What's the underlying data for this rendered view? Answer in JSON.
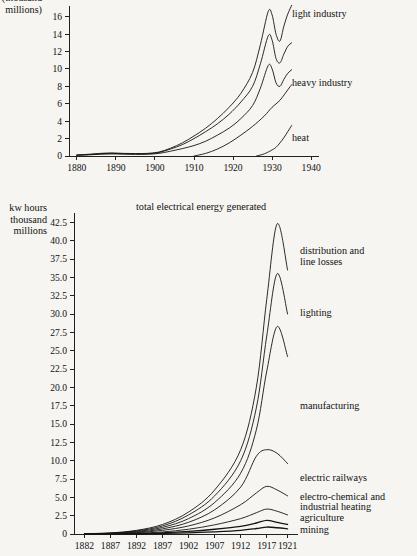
{
  "page": {
    "background_color": "#f6f5f1",
    "ink_color": "#141414"
  },
  "chart_data": [
    {
      "id": "top",
      "type": "line",
      "title": "",
      "ylabel_lines": [
        "(thousand",
        "millions)"
      ],
      "ylabel_line1": "(thousand",
      "ylabel_line2": "millions)",
      "xlabel": "",
      "grid": false,
      "legend_position": "right-inline",
      "xlim": [
        1878,
        1942
      ],
      "ylim": [
        0,
        17
      ],
      "xticks": [
        1880,
        1890,
        1900,
        1910,
        1920,
        1930,
        1940
      ],
      "xticklabels": [
        "1880",
        "1890",
        "1900",
        "1910",
        "1920",
        "1930",
        "1940"
      ],
      "yticks": [
        0,
        2,
        4,
        6,
        8,
        10,
        12,
        14,
        16
      ],
      "yticklabels": [
        "0",
        "2",
        "4",
        "6",
        "8",
        "10",
        "12",
        "14",
        "16"
      ],
      "series": [
        {
          "name": "light industry",
          "label": "light industry",
          "x": [
            1880,
            1883,
            1886,
            1889,
            1892,
            1895,
            1898,
            1901,
            1904,
            1907,
            1910,
            1913,
            1916,
            1919,
            1922,
            1925,
            1927,
            1929,
            1930,
            1931,
            1932,
            1933,
            1934,
            1935
          ],
          "values": [
            0.12,
            0.2,
            0.3,
            0.35,
            0.3,
            0.28,
            0.3,
            0.45,
            0.9,
            1.5,
            2.3,
            3.2,
            4.3,
            5.6,
            7.2,
            9.6,
            12.8,
            16.6,
            16.2,
            14.0,
            13.2,
            14.9,
            16.3,
            17.3
          ]
        },
        {
          "name": "heavy industry",
          "label": "heavy industry",
          "x": [
            1880,
            1883,
            1886,
            1889,
            1892,
            1895,
            1898,
            1901,
            1904,
            1907,
            1910,
            1913,
            1916,
            1919,
            1922,
            1925,
            1927,
            1929,
            1930,
            1931,
            1932,
            1933,
            1934,
            1935
          ],
          "values": [
            0.1,
            0.16,
            0.25,
            0.3,
            0.26,
            0.24,
            0.26,
            0.4,
            0.8,
            1.3,
            2.0,
            2.8,
            3.7,
            4.8,
            6.2,
            8.0,
            10.6,
            13.8,
            13.3,
            11.2,
            10.7,
            11.7,
            12.6,
            13.0
          ]
        },
        {
          "name": "heat",
          "label": "heat",
          "x": [
            1880,
            1883,
            1886,
            1889,
            1892,
            1895,
            1898,
            1901,
            1904,
            1907,
            1910,
            1913,
            1916,
            1919,
            1922,
            1925,
            1927,
            1929,
            1930,
            1931,
            1932,
            1933,
            1934,
            1935
          ],
          "values": [
            0.08,
            0.13,
            0.2,
            0.24,
            0.21,
            0.19,
            0.2,
            0.3,
            0.55,
            0.85,
            1.2,
            1.7,
            2.4,
            3.2,
            4.3,
            5.8,
            7.8,
            10.4,
            10.0,
            8.4,
            8.0,
            8.8,
            9.5,
            9.9
          ]
        },
        {
          "name": "heat-lower",
          "label": "",
          "x": [
            1910,
            1913,
            1916,
            1919,
            1922,
            1925,
            1928,
            1930,
            1932,
            1934,
            1935
          ],
          "values": [
            0.0,
            0.3,
            0.8,
            1.5,
            2.4,
            3.4,
            4.6,
            5.6,
            6.4,
            7.6,
            8.2
          ]
        },
        {
          "name": "heat-curve",
          "label": "",
          "x": [
            1926,
            1928,
            1930,
            1931,
            1932,
            1933,
            1934,
            1935
          ],
          "values": [
            0.0,
            0.25,
            0.7,
            1.0,
            1.5,
            2.1,
            2.8,
            3.5
          ]
        }
      ],
      "inline_labels": [
        {
          "text": "light industry",
          "x": 292,
          "y": 17
        },
        {
          "text": "heavy industry",
          "x": 292,
          "y": 86
        },
        {
          "text": "heat",
          "x": 292,
          "y": 141
        }
      ]
    },
    {
      "id": "bottom",
      "type": "line",
      "title": "total electrical energy generated",
      "ylabel_lines": [
        "kw hours",
        "thousand",
        "millions"
      ],
      "ylabel_line1": "kw hours",
      "ylabel_line2": "thousand",
      "ylabel_line3": "millions",
      "xlabel": "",
      "grid": false,
      "legend_position": "right-inline",
      "xlim": [
        1880,
        1923
      ],
      "ylim": [
        0,
        43.5
      ],
      "xticks": [
        1882,
        1887,
        1892,
        1897,
        1902,
        1907,
        1912,
        1917,
        1921
      ],
      "xticklabels": [
        "1882",
        "1887",
        "1892",
        "1897",
        "1902",
        "1907",
        "1912",
        "1917",
        "1921"
      ],
      "yticks": [
        0,
        2.5,
        5.0,
        7.5,
        10.0,
        12.5,
        15.0,
        17.5,
        20.0,
        22.5,
        25.0,
        27.5,
        30.0,
        32.5,
        35.0,
        37.5,
        40.0,
        42.5
      ],
      "yticklabels": [
        "0",
        "2.5",
        "5.0",
        "7.5",
        "10.0",
        "12.5",
        "15.0",
        "17.5",
        "20.0",
        "22.5",
        "25.0",
        "27.5",
        "30.0",
        "32.5",
        "35.0",
        "37.5",
        "40.0",
        "42.5"
      ],
      "series": [
        {
          "name": "total electrical energy generated",
          "label": "total electrical energy generated",
          "x": [
            1882,
            1887,
            1892,
            1897,
            1902,
            1907,
            1912,
            1915,
            1917,
            1919,
            1921
          ],
          "values": [
            0.05,
            0.15,
            0.5,
            1.3,
            3.0,
            6.0,
            11.5,
            20.0,
            32.0,
            42.3,
            36.0
          ]
        },
        {
          "name": "distribution and line losses",
          "label": "distribution and line losses",
          "x": [
            1882,
            1887,
            1892,
            1897,
            1902,
            1907,
            1912,
            1915,
            1917,
            1919,
            1921
          ],
          "values": [
            0.04,
            0.12,
            0.42,
            1.1,
            2.6,
            5.2,
            10.0,
            17.2,
            27.0,
            35.5,
            30.0
          ]
        },
        {
          "name": "lighting",
          "label": "lighting",
          "x": [
            1882,
            1887,
            1892,
            1897,
            1902,
            1907,
            1912,
            1915,
            1917,
            1919,
            1921
          ],
          "values": [
            0.03,
            0.1,
            0.34,
            0.9,
            2.1,
            4.3,
            8.3,
            14.2,
            22.2,
            28.3,
            24.2
          ]
        },
        {
          "name": "manufacturing",
          "label": "manufacturing",
          "x": [
            1882,
            1887,
            1892,
            1897,
            1902,
            1907,
            1912,
            1915,
            1917,
            1919,
            1921
          ],
          "values": [
            0.02,
            0.07,
            0.25,
            0.7,
            1.6,
            3.3,
            6.4,
            10.6,
            11.5,
            11.0,
            9.6
          ]
        },
        {
          "name": "electric railways",
          "label": "electric railways",
          "x": [
            1882,
            1887,
            1892,
            1897,
            1902,
            1907,
            1912,
            1915,
            1917,
            1919,
            1921
          ],
          "values": [
            0.015,
            0.05,
            0.18,
            0.5,
            1.1,
            2.2,
            4.0,
            5.6,
            6.5,
            6.0,
            5.2
          ]
        },
        {
          "name": "electro-chemical and industrial heating",
          "label": "electro-chemical and industrial heating",
          "x": [
            1882,
            1887,
            1892,
            1897,
            1902,
            1907,
            1912,
            1915,
            1917,
            1919,
            1921
          ],
          "values": [
            0.01,
            0.03,
            0.1,
            0.28,
            0.65,
            1.25,
            2.1,
            2.9,
            3.4,
            3.1,
            2.6
          ]
        },
        {
          "name": "agriculture",
          "label": "agriculture",
          "x": [
            1882,
            1887,
            1892,
            1897,
            1902,
            1907,
            1912,
            1915,
            1917,
            1919,
            1921
          ],
          "values": [
            0.008,
            0.02,
            0.06,
            0.16,
            0.35,
            0.65,
            1.05,
            1.5,
            1.85,
            1.6,
            1.3
          ]
        },
        {
          "name": "mining",
          "label": "mining",
          "x": [
            1882,
            1887,
            1892,
            1897,
            1902,
            1907,
            1912,
            1915,
            1917,
            1919,
            1921
          ],
          "values": [
            0.004,
            0.01,
            0.03,
            0.08,
            0.16,
            0.3,
            0.5,
            0.75,
            0.95,
            0.85,
            0.7
          ]
        }
      ],
      "inline_labels": [
        {
          "text": "distribution and",
          "x": 300,
          "y": 254
        },
        {
          "text": "line losses",
          "x": 300,
          "y": 265
        },
        {
          "text": "lighting",
          "x": 300,
          "y": 316
        },
        {
          "text": "manufacturing",
          "x": 300,
          "y": 409
        },
        {
          "text": "electric railways",
          "x": 300,
          "y": 481
        },
        {
          "text": "electro-chemical and",
          "x": 300,
          "y": 500
        },
        {
          "text": "industrial heating",
          "x": 300,
          "y": 510
        },
        {
          "text": "agriculture",
          "x": 300,
          "y": 521
        },
        {
          "text": "mining",
          "x": 300,
          "y": 533
        }
      ]
    }
  ]
}
